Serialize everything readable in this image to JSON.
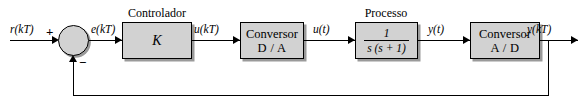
{
  "diagram": {
    "type": "block-diagram",
    "background": "#ffffff",
    "block_fill": "#d2d2d2",
    "line_color": "#000000",
    "shadow_color": "#9a9a9a"
  },
  "signals": {
    "reference": "r(kT)",
    "error": "e(kT)",
    "control_discrete": "u(kT)",
    "control_continuous": "u(t)",
    "output_continuous": "y(t)",
    "output_discrete": "y(kT)"
  },
  "summing_junction": {
    "name": "comparador",
    "plus_sign": "+",
    "minus_sign": "−"
  },
  "blocks": [
    {
      "id": "controlador",
      "caption": "Controlador",
      "line1": "K",
      "line2": ""
    },
    {
      "id": "conversor-da",
      "caption": "",
      "line1": "Conversor",
      "line2": "D / A"
    },
    {
      "id": "processo",
      "caption": "Processo",
      "numerator": "1",
      "denominator": "s (s + 1)"
    },
    {
      "id": "conversor-ad",
      "caption": "",
      "line1": "Conversor",
      "line2": "A / D"
    }
  ]
}
